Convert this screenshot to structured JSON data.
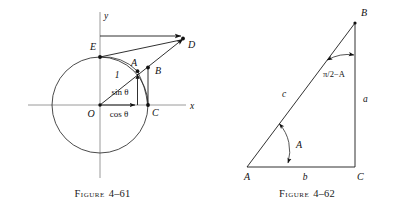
{
  "page": {
    "width": 409,
    "height": 207,
    "background": "#ffffff",
    "ink": "#111111",
    "axis_color": "#9a9a9a"
  },
  "figures": [
    {
      "id": "figure-4-61",
      "caption_word": "Figure",
      "caption_number": "4–61",
      "description": "Unit circle with angle theta showing sin, cos, tan construction",
      "axes": {
        "y_label": "y",
        "x_label": "x",
        "origin_label": "O"
      },
      "points": [
        {
          "name": "O",
          "label": "O"
        },
        {
          "name": "E",
          "label": "E"
        },
        {
          "name": "A",
          "label": "A"
        },
        {
          "name": "B",
          "label": "B"
        },
        {
          "name": "C",
          "label": "C"
        },
        {
          "name": "D",
          "label": "D"
        }
      ],
      "annotations": [
        {
          "name": "radius",
          "label": "1"
        },
        {
          "name": "sine",
          "label": "sin θ"
        },
        {
          "name": "cosine",
          "label": "cos θ"
        }
      ]
    },
    {
      "id": "figure-4-62",
      "caption_word": "Figure",
      "caption_number": "4–62",
      "description": "Right triangle ABC with legs a and b, hypotenuse c, angle A at vertex A and pi/2 minus A at vertex B",
      "points": [
        {
          "name": "A",
          "label": "A"
        },
        {
          "name": "B",
          "label": "B"
        },
        {
          "name": "C",
          "label": "C"
        }
      ],
      "sides": [
        {
          "name": "side-a",
          "label": "a"
        },
        {
          "name": "side-b",
          "label": "b"
        },
        {
          "name": "side-c",
          "label": "c"
        }
      ],
      "angles": [
        {
          "name": "angle-A",
          "label": "A"
        },
        {
          "name": "angle-B",
          "label": "π/2−A"
        }
      ]
    }
  ]
}
